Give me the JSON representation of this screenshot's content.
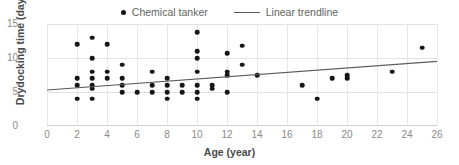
{
  "chart_data": {
    "type": "scatter",
    "title": "",
    "xlabel": "Age (year)",
    "ylabel": "Drydocking time (day)",
    "xlim": [
      0,
      26
    ],
    "ylim": [
      0,
      15
    ],
    "xticks": [
      0,
      2,
      4,
      6,
      8,
      10,
      12,
      14,
      16,
      18,
      20,
      22,
      24,
      26
    ],
    "yticks": [
      0,
      5,
      10,
      15
    ],
    "grid": true,
    "legend_position": "top-center",
    "legend": [
      {
        "label": "Chemical tanker",
        "marker": "dot",
        "color": "#161616"
      },
      {
        "label": "Linear trendline",
        "marker": "line",
        "color": "#5a5a5a"
      }
    ],
    "series": [
      {
        "name": "Chemical tanker",
        "marker": "dot",
        "color": "#161616",
        "points": [
          [
            2,
            12
          ],
          [
            2,
            7
          ],
          [
            2,
            6
          ],
          [
            2,
            4
          ],
          [
            3,
            13
          ],
          [
            3,
            10
          ],
          [
            3,
            8
          ],
          [
            3,
            7
          ],
          [
            3,
            6
          ],
          [
            3,
            5.5
          ],
          [
            3,
            4
          ],
          [
            4,
            12
          ],
          [
            4,
            8
          ],
          [
            4,
            7
          ],
          [
            5,
            9
          ],
          [
            5,
            7
          ],
          [
            5,
            6
          ],
          [
            5,
            5
          ],
          [
            6,
            5
          ],
          [
            7,
            8
          ],
          [
            7,
            6
          ],
          [
            7,
            5
          ],
          [
            8,
            7
          ],
          [
            8,
            6
          ],
          [
            8,
            5
          ],
          [
            8,
            4
          ],
          [
            9,
            6
          ],
          [
            9,
            5
          ],
          [
            10,
            13.8
          ],
          [
            10,
            11
          ],
          [
            10,
            10
          ],
          [
            10,
            8
          ],
          [
            10,
            6
          ],
          [
            10,
            5
          ],
          [
            10,
            4
          ],
          [
            11,
            6
          ],
          [
            11,
            5.5
          ],
          [
            12,
            10.7
          ],
          [
            12,
            8
          ],
          [
            12,
            7.5
          ],
          [
            12,
            5
          ],
          [
            13,
            11.8
          ],
          [
            13,
            9
          ],
          [
            14,
            7.5
          ],
          [
            17,
            6
          ],
          [
            18,
            4
          ],
          [
            19,
            7
          ],
          [
            20,
            7.5
          ],
          [
            20,
            7
          ],
          [
            23,
            8
          ],
          [
            25,
            11.5
          ]
        ]
      }
    ],
    "trendline": {
      "name": "Linear trendline",
      "color": "#5a5a5a",
      "x_start": 0,
      "y_start": 5.3,
      "x_end": 26,
      "y_end": 9.5
    }
  }
}
